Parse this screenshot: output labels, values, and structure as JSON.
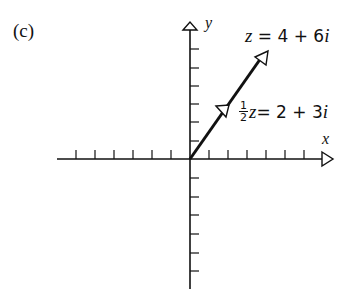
{
  "panel_label": "(c)",
  "axes": {
    "x_label": "x",
    "y_label": "y",
    "origin_px": [
      190,
      159
    ],
    "tick_spacing_px": 19,
    "x_ticks_left": 6,
    "x_ticks_right": 6,
    "y_ticks_up": 6,
    "y_ticks_down": 6
  },
  "vectors": [
    {
      "name": "z",
      "label_var": "z",
      "label_rest": " = 4 + 6",
      "label_i": "i",
      "re": 4,
      "im": 6
    },
    {
      "name": "half_z",
      "frac_num": "1",
      "frac_den": "2",
      "label_var": "z",
      "label_rest": " = 2 + 3",
      "label_i": "i",
      "re": 2,
      "im": 3
    }
  ],
  "colors": {
    "ink": "#111111",
    "background": "#ffffff"
  }
}
